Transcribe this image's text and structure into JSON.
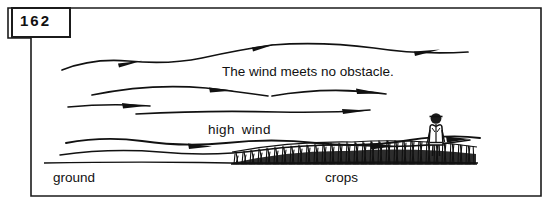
{
  "figure": {
    "page_number": "162",
    "frame_color": "#1b1b1b",
    "ink_color": "#111111",
    "background_color": "#ffffff",
    "labels": {
      "caption": "The wind meets no obstacle.",
      "high_wind": "high wind",
      "ground": "ground",
      "crops": "crops"
    },
    "icons": {
      "person": "farmer-figure-icon",
      "crops": "crop-field-icon",
      "wind": "wind-arrow-icon"
    },
    "diagram_elements": [
      {
        "name": "wind-arrow-line-1",
        "description": "top wavy wind streamline with mid-line arrowhead and trailing arrowhead at right",
        "arrowheads": 2
      },
      {
        "name": "wind-arrow-line-2",
        "description": "second wind streamline arcing right with arrowhead near center",
        "arrowheads": 1
      },
      {
        "name": "wind-arrow-line-3",
        "description": "short left wind streamline with arrowhead",
        "arrowheads": 1
      },
      {
        "name": "wind-arrow-line-4",
        "description": "long mid wind streamline with arrowhead at right",
        "arrowheads": 1
      },
      {
        "name": "wind-arrow-line-5",
        "description": "lower wind streamline beneath high wind label with arrowhead at right",
        "arrowheads": 1
      },
      {
        "name": "wind-arrow-line-6",
        "description": "near-ground wavy wind streamline running over the crops with arrowheads",
        "arrowheads": 2
      },
      {
        "name": "ground-line",
        "description": "horizontal ground surface line"
      },
      {
        "name": "crop-field",
        "description": "dense band of crop stalks along the ground at right of center"
      },
      {
        "name": "farmer-figure",
        "description": "standing person in the crop field at right"
      }
    ]
  }
}
